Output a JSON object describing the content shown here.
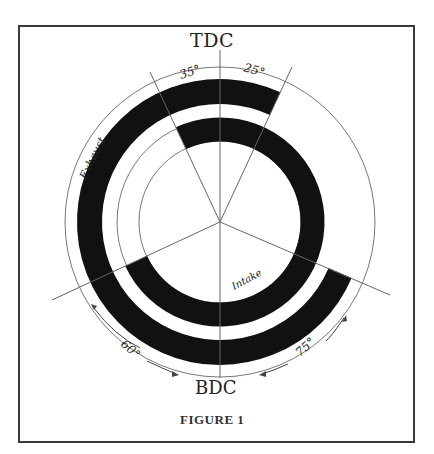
{
  "figure": {
    "title": "FIGURE 1",
    "top_label": "TDC",
    "bottom_label": "BDC",
    "rings": {
      "outer_label": "Exhaust",
      "inner_label": "Intake"
    },
    "angles": {
      "intake_opens_before_tdc": "35°",
      "exhaust_closes_after_tdc": "25°",
      "exhaust_opens_before_bdc": "60°",
      "intake_closes_after_bdc": "75°"
    },
    "colors": {
      "ring": "#111111",
      "line": "#555555",
      "frame": "#3a3a3a"
    }
  }
}
